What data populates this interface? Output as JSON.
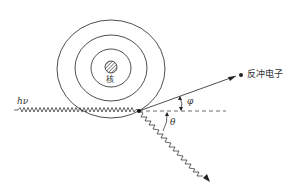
{
  "diagram": {
    "type": "compton-scattering",
    "labels": {
      "incident_photon": "hν",
      "nucleus": "核",
      "recoil_electron": "反冲电子",
      "electron_angle": "φ",
      "photon_angle": "θ"
    },
    "colors": {
      "stroke": "#222222",
      "text": "#333333"
    }
  }
}
